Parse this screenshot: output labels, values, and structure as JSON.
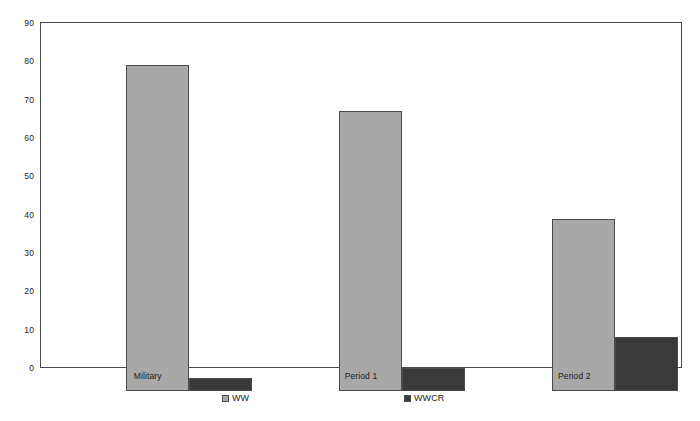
{
  "chart_data": {
    "type": "bar",
    "title": "",
    "subtitle": "",
    "xlabel": "",
    "ylabel": "",
    "categories": [
      "Military",
      "Period 1",
      "Period 2"
    ],
    "series": [
      {
        "name": "WW",
        "values": [
          85,
          73,
          45
        ],
        "color": "#a8a8a8"
      },
      {
        "name": "WWCR",
        "values": [
          3.5,
          6,
          14
        ],
        "color": "#3a3a3a"
      }
    ],
    "ylim": [
      0,
      90
    ],
    "yticks": [
      0,
      10,
      20,
      30,
      40,
      50,
      60,
      70,
      80,
      90
    ],
    "ytick_labels": [
      "0",
      "10",
      "20",
      "30",
      "40",
      "50",
      "60",
      "70",
      "80",
      "90"
    ],
    "grid": false,
    "legend_position": "bottom",
    "axis_color": "#4a4a4a",
    "bar_border_color": "#4b4b4b",
    "background": "#ffffff"
  },
  "legend": {
    "entries": [
      {
        "label": "WW",
        "color": "#a8a8a8",
        "left_px": 222
      },
      {
        "label": "WWCR",
        "color": "#3a3a3a",
        "left_px": 404
      }
    ]
  }
}
